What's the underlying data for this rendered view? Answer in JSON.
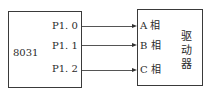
{
  "left_block": {
    "label": "8031",
    "ports": [
      "P1. 0",
      "P1. 1",
      "P1. 2"
    ]
  },
  "right_block": {
    "inputs": [
      "A 相",
      "B 相",
      "C 相"
    ],
    "label_chars": [
      "驱",
      "动",
      "器"
    ]
  }
}
